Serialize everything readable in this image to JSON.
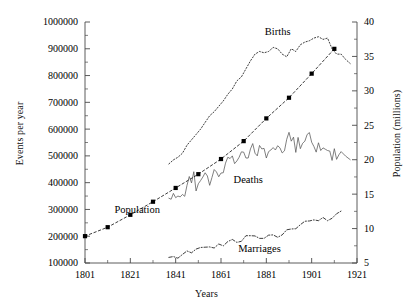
{
  "chart_data": {
    "type": "line",
    "title": "",
    "xlabel": "Years",
    "ylabel": "Events per year",
    "ylabel_right": "Population (millions)",
    "xlim": [
      1801,
      1921
    ],
    "ylim": [
      100000,
      1000000
    ],
    "ylim_right": [
      5,
      40
    ],
    "grid": false,
    "legend": "inline-annotations",
    "x_ticks": [
      "1801",
      "1821",
      "1841",
      "1861",
      "1881",
      "1901",
      "1921"
    ],
    "x_tick_values": [
      1801,
      1821,
      1841,
      1861,
      1881,
      1901,
      1921
    ],
    "x_minor_step": 10,
    "y_ticks": [
      "100000",
      "200000",
      "300000",
      "400000",
      "500000",
      "600000",
      "700000",
      "800000",
      "900000",
      "1000000"
    ],
    "y_tick_values": [
      100000,
      200000,
      300000,
      400000,
      500000,
      600000,
      700000,
      800000,
      900000,
      1000000
    ],
    "y_minor_step": 50000,
    "y_right_ticks": [
      "5",
      "10",
      "15",
      "20",
      "25",
      "30",
      "35",
      "40"
    ],
    "y_right_tick_values": [
      5,
      10,
      15,
      20,
      25,
      30,
      35,
      40
    ],
    "y_right_minor_step": 2.5,
    "series": [
      {
        "name": "Births",
        "label": "Births",
        "axis": "left",
        "style": "dotted",
        "marker": "none",
        "label_x": 1886,
        "label_y": 952000,
        "x": [
          1838,
          1840,
          1842,
          1844,
          1846,
          1848,
          1850,
          1852,
          1854,
          1856,
          1858,
          1860,
          1862,
          1864,
          1866,
          1868,
          1870,
          1872,
          1874,
          1876,
          1878,
          1880,
          1882,
          1884,
          1886,
          1888,
          1890,
          1892,
          1894,
          1896,
          1898,
          1900,
          1902,
          1904,
          1906,
          1908,
          1910,
          1912,
          1914,
          1916,
          1918
        ],
        "y": [
          470000,
          485000,
          495000,
          510000,
          540000,
          560000,
          580000,
          600000,
          625000,
          650000,
          665000,
          685000,
          705000,
          730000,
          750000,
          780000,
          795000,
          825000,
          855000,
          880000,
          890000,
          885000,
          890000,
          905000,
          900000,
          880000,
          870000,
          900000,
          890000,
          915000,
          925000,
          930000,
          940000,
          945000,
          935000,
          940000,
          900000,
          880000,
          880000,
          860000,
          845000
        ]
      },
      {
        "name": "Deaths",
        "label": "Deaths",
        "axis": "left",
        "style": "solid",
        "marker": "none",
        "label_x": 1873,
        "label_y": 398000,
        "x": [
          1838,
          1839,
          1840,
          1841,
          1842,
          1843,
          1844,
          1845,
          1846,
          1847,
          1848,
          1849,
          1850,
          1851,
          1852,
          1853,
          1854,
          1855,
          1856,
          1857,
          1858,
          1859,
          1860,
          1861,
          1862,
          1863,
          1864,
          1865,
          1866,
          1867,
          1868,
          1869,
          1870,
          1871,
          1872,
          1873,
          1874,
          1875,
          1876,
          1877,
          1878,
          1879,
          1880,
          1881,
          1882,
          1883,
          1884,
          1885,
          1886,
          1887,
          1888,
          1889,
          1890,
          1891,
          1892,
          1893,
          1894,
          1895,
          1896,
          1897,
          1898,
          1899,
          1900,
          1901,
          1902,
          1903,
          1904,
          1905,
          1906,
          1907,
          1908,
          1909,
          1910,
          1911,
          1912,
          1913,
          1914,
          1916,
          1918
        ],
        "y": [
          342000,
          338000,
          360000,
          344000,
          350000,
          347000,
          356000,
          349000,
          390000,
          423000,
          399000,
          441000,
          369000,
          396000,
          408000,
          421000,
          437000,
          425000,
          390000,
          419000,
          449000,
          440000,
          422000,
          436000,
          437000,
          473000,
          495000,
          490000,
          500000,
          471000,
          481000,
          495000,
          515000,
          514000,
          492000,
          492000,
          526000,
          546000,
          510000,
          500000,
          539000,
          526000,
          528000,
          492000,
          516000,
          522000,
          531000,
          522000,
          538000,
          530000,
          511000,
          519000,
          562000,
          588000,
          555000,
          570000,
          513000,
          569000,
          527000,
          547000,
          555000,
          580000,
          587000,
          551000,
          535000,
          514000,
          549000,
          520000,
          530000,
          525000,
          520000,
          518000,
          483000,
          527000,
          487000,
          504000,
          516000,
          499000,
          486000
        ]
      },
      {
        "name": "Marriages",
        "label": "Marriages",
        "axis": "left",
        "style": "dash-dot",
        "marker": "none",
        "label_x": 1878,
        "label_y": 141000,
        "x": [
          1838,
          1840,
          1842,
          1844,
          1846,
          1848,
          1850,
          1852,
          1854,
          1856,
          1858,
          1860,
          1862,
          1864,
          1866,
          1868,
          1870,
          1872,
          1874,
          1876,
          1878,
          1880,
          1882,
          1884,
          1886,
          1888,
          1890,
          1892,
          1894,
          1896,
          1898,
          1900,
          1902,
          1904,
          1906,
          1908,
          1910,
          1912,
          1914
        ],
        "y": [
          121000,
          124000,
          118000,
          132000,
          145000,
          138000,
          152000,
          158000,
          159000,
          160000,
          156000,
          171000,
          164000,
          180000,
          188000,
          177000,
          181000,
          202000,
          202000,
          201000,
          192000,
          192000,
          204000,
          205000,
          196000,
          205000,
          224000,
          227000,
          228000,
          243000,
          256000,
          257000,
          261000,
          258000,
          270000,
          258000,
          267000,
          284000,
          294000
        ]
      },
      {
        "name": "Population",
        "label": "Population",
        "axis": "right",
        "style": "dashed",
        "marker": "square",
        "label_x": 1824,
        "label_y": 12.3,
        "x": [
          1801,
          1811,
          1821,
          1831,
          1841,
          1851,
          1861,
          1871,
          1881,
          1891,
          1901,
          1911
        ],
        "y": [
          8.9,
          10.2,
          12.0,
          13.9,
          15.9,
          17.9,
          20.1,
          22.7,
          26.0,
          29.0,
          32.5,
          36.1
        ]
      }
    ]
  }
}
